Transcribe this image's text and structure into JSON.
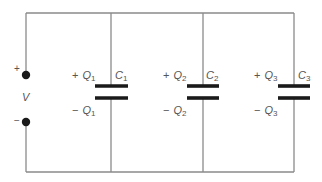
{
  "diagram": {
    "type": "circuit",
    "source": {
      "label": "V",
      "positive_sign": "+",
      "negative_sign": "−"
    },
    "capacitors": [
      {
        "name": "C",
        "index": "1",
        "charge_symbol": "Q",
        "plus_sign": "+",
        "minus_sign": "−"
      },
      {
        "name": "C",
        "index": "2",
        "charge_symbol": "Q",
        "plus_sign": "+",
        "minus_sign": "−"
      },
      {
        "name": "C",
        "index": "3",
        "charge_symbol": "Q",
        "plus_sign": "+",
        "minus_sign": "−"
      }
    ]
  }
}
